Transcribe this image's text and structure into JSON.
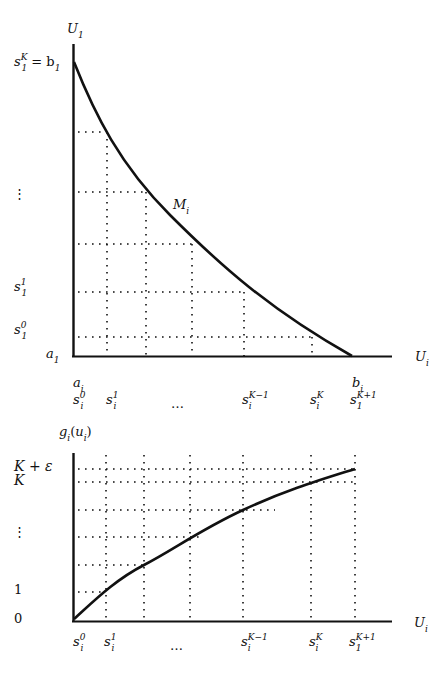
{
  "top_graph": {
    "y_axis_label": "U",
    "y_axis_sub": "1",
    "x_axis_label": "U",
    "x_axis_sub": "i",
    "curve_label": "M",
    "curve_sub": "i",
    "y_tick_labels": [
      {
        "id": "skb1",
        "text": "s",
        "sub": "1",
        "sup": "K",
        "suffix": " = b",
        "suffix_sub": "1"
      },
      {
        "id": "vdots",
        "text": "⋮"
      },
      {
        "id": "s11",
        "text": "s",
        "sub": "1",
        "sup": "1"
      },
      {
        "id": "s10",
        "text": "s",
        "sub": "1",
        "sup": "0"
      },
      {
        "id": "a1",
        "text": "a",
        "sub": "1"
      }
    ],
    "x_tick_labels_row1": [
      {
        "id": "ai",
        "text": "a",
        "sub": "i"
      },
      {
        "id": "bi",
        "text": "b",
        "sub": "i"
      }
    ],
    "x_tick_labels_row2": [
      {
        "id": "si0",
        "text": "s",
        "sub": "i",
        "sup": "0"
      },
      {
        "id": "si1",
        "text": "s",
        "sub": "i",
        "sup": "1"
      },
      {
        "id": "dots",
        "text": "…"
      },
      {
        "id": "siKm1",
        "text": "s",
        "sub": "i",
        "sup": "K−1"
      },
      {
        "id": "siK",
        "text": "s",
        "sub": "i",
        "sup": "K"
      },
      {
        "id": "s1Kp1",
        "text": "s",
        "sub": "1",
        "sup": "K+1"
      }
    ]
  },
  "bottom_graph": {
    "y_axis_label": "g",
    "y_axis_sub": "i",
    "y_axis_arg": "(u",
    "y_axis_arg_sub": "i",
    "y_axis_close": ")",
    "x_axis_label": "U",
    "x_axis_sub": "i",
    "y_tick_labels": [
      {
        "id": "Keps",
        "text": "K + ε"
      },
      {
        "id": "K",
        "text": "K"
      },
      {
        "id": "vdots",
        "text": "⋮"
      },
      {
        "id": "one",
        "text": "1"
      },
      {
        "id": "zero",
        "text": "0"
      }
    ],
    "x_tick_labels": [
      {
        "id": "si0",
        "text": "s",
        "sub": "i",
        "sup": "0"
      },
      {
        "id": "si1",
        "text": "s",
        "sub": "i",
        "sup": "1"
      },
      {
        "id": "dots",
        "text": "…"
      },
      {
        "id": "siKm1",
        "text": "s",
        "sub": "i",
        "sup": "K−1"
      },
      {
        "id": "siK",
        "text": "s",
        "sub": "i",
        "sup": "K"
      },
      {
        "id": "s1Kp1",
        "text": "s",
        "sub": "1",
        "sup": "K+1"
      }
    ]
  },
  "colors": {
    "ink": "#111111",
    "background": "#ffffff"
  }
}
